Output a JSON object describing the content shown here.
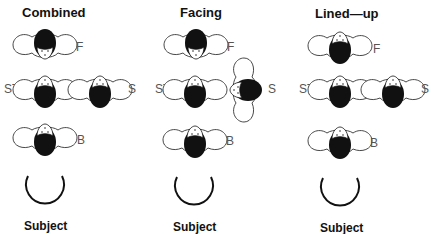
{
  "panels": [
    {
      "title": "Combined",
      "labels": {
        "F": "F",
        "ST": "ST",
        "S": "S",
        "B": "B"
      },
      "subject": "Subject"
    },
    {
      "title": "Facing",
      "labels": {
        "F": "F",
        "ST": "ST",
        "S": "S",
        "B": "B"
      },
      "subject": "Subject"
    },
    {
      "title": "Lined—up",
      "labels": {
        "F": "F",
        "ST": "ST",
        "S": "S",
        "B": "B"
      },
      "subject": "Subject"
    }
  ],
  "colors": {
    "ink": "#111111",
    "label": "#555555",
    "outline": "#333333"
  }
}
